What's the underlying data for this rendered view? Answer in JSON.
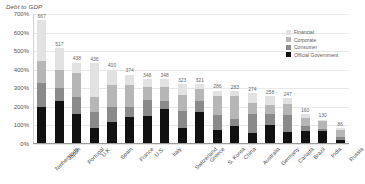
{
  "chart_data": {
    "type": "bar",
    "subtype": "stacked-bar",
    "title": "Debt to GDP",
    "xlabel": "",
    "ylabel": "",
    "ylim": [
      0,
      700
    ],
    "ytick_labels": [
      "700%",
      "600%",
      "500%",
      "400%",
      "300%",
      "200%",
      "100%",
      "0%"
    ],
    "ytick_values": [
      700,
      600,
      500,
      400,
      300,
      200,
      100,
      0
    ],
    "grid": true,
    "legend_position": "top-right",
    "units": "percent of GDP",
    "categories": [
      "Netherlands",
      "Japan",
      "Portugal",
      "U.K.",
      "Spain",
      "France",
      "U.S.",
      "Italy",
      "Switzerland",
      "Greece",
      "S. Korea",
      "China",
      "Australia",
      "Germany",
      "Canada",
      "Brazil",
      "India",
      "Russia"
    ],
    "totals": [
      667,
      517,
      438,
      436,
      400,
      374,
      348,
      348,
      323,
      321,
      286,
      283,
      274,
      258,
      247,
      160,
      130,
      86
    ],
    "series": [
      {
        "name": "Financial",
        "color": "#e2e2e2",
        "values": [
          220,
          118,
          53,
          182,
          80,
          56,
          41,
          42,
          60,
          22,
          25,
          25,
          53,
          50,
          33,
          21,
          7,
          8
        ]
      },
      {
        "name": "Corporate",
        "color": "#b6b6b6",
        "values": [
          120,
          99,
          131,
          83,
          121,
          118,
          70,
          76,
          87,
          65,
          105,
          124,
          59,
          49,
          58,
          44,
          44,
          40
        ]
      },
      {
        "name": "Consumer",
        "color": "#8a8a8a",
        "values": [
          127,
          67,
          91,
          83,
          82,
          56,
          87,
          43,
          91,
          62,
          81,
          39,
          105,
          58,
          91,
          25,
          11,
          17
        ]
      },
      {
        "name": "Official Government",
        "color": "#111111",
        "values": [
          200,
          233,
          163,
          88,
          117,
          144,
          150,
          187,
          85,
          172,
          75,
          95,
          57,
          101,
          65,
          70,
          68,
          21
        ]
      }
    ]
  },
  "legend": {
    "items": [
      {
        "label": "Financial",
        "color": "#e2e2e2"
      },
      {
        "label": "Corporate",
        "color": "#b6b6b6"
      },
      {
        "label": "Consumer",
        "color": "#8a8a8a"
      },
      {
        "label": "Official Government",
        "color": "#111111"
      }
    ]
  }
}
